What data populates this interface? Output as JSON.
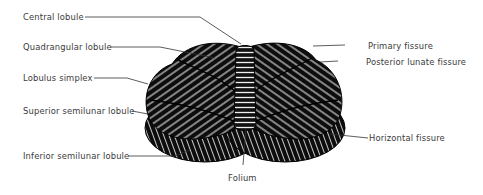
{
  "figure": {
    "colors": {
      "ink": "#111111",
      "label_text": "#3a3a3a",
      "leader_line": "#333333",
      "background": "#ffffff"
    }
  },
  "labels_left": [
    {
      "id": "central-lobule",
      "text": "Central lobule"
    },
    {
      "id": "quadrangular-lobule",
      "text": "Quadrangular lobule"
    },
    {
      "id": "lobulus-simplex",
      "text": "Lobulus simplex"
    },
    {
      "id": "superior-semilunar-lobule",
      "text": "Superior semilunar lobule"
    },
    {
      "id": "inferior-semilunar-lobule",
      "text": "Inferior semilunar lobule"
    }
  ],
  "labels_right": [
    {
      "id": "primary-fissure",
      "text": "Primary fissure"
    },
    {
      "id": "posterior-lunate-fissure",
      "text": "Posterior lunate fissure"
    },
    {
      "id": "horizontal-fissure",
      "text": "Horizontal fissure"
    }
  ],
  "labels_bottom": [
    {
      "id": "folium",
      "text": "Folium"
    }
  ]
}
